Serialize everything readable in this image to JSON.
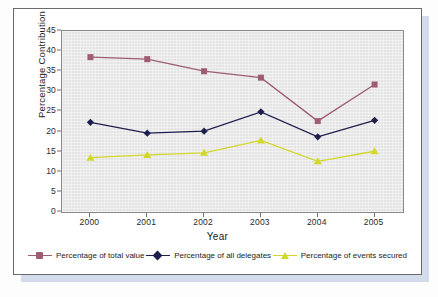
{
  "figure": {
    "axis_title_y": "Percentage Contribution",
    "axis_title_x": "Year"
  },
  "chart_data": {
    "type": "line",
    "title": "",
    "xlabel": "Year",
    "ylabel": "Percentage Contribution",
    "categories": [
      "2000",
      "2001",
      "2002",
      "2003",
      "2004",
      "2005"
    ],
    "ylim": [
      0,
      45
    ],
    "yticks": [
      0,
      5,
      10,
      15,
      20,
      25,
      30,
      35,
      40,
      45
    ],
    "grid": false,
    "legend_position": "bottom",
    "series": [
      {
        "name": "Percentage of total value",
        "color": "#9e5d72",
        "marker": "square",
        "values": [
          38.5,
          38.0,
          35.0,
          33.4,
          22.6,
          31.7
        ]
      },
      {
        "name": "Percentage of all delegates",
        "color": "#1f1f4e",
        "marker": "diamond",
        "values": [
          22.3,
          19.6,
          20.1,
          24.9,
          18.7,
          22.8
        ]
      },
      {
        "name": "Percentage of events secured",
        "color": "#d2d82a",
        "marker": "triangle",
        "values": [
          13.5,
          14.2,
          14.7,
          17.8,
          12.6,
          15.1
        ]
      }
    ]
  },
  "legend": {
    "items": [
      {
        "label": "Percentage of total value"
      },
      {
        "label": "Percentage of all delegates"
      },
      {
        "label": "Percentage of events secured"
      }
    ]
  }
}
